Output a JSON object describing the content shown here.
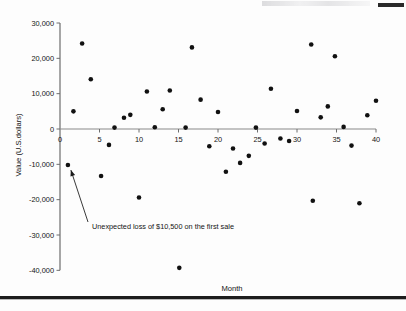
{
  "page": {
    "background_color": "#ffffff",
    "bottom_rule_color": "#1d1d1d"
  },
  "chart_data": {
    "type": "scatter",
    "title": "",
    "xlabel": "Month",
    "ylabel": "Value (U.S.dollars)",
    "xlim": [
      0,
      40
    ],
    "ylim": [
      -40000,
      30000
    ],
    "xticks": [
      0,
      5,
      10,
      15,
      20,
      25,
      30,
      35,
      40
    ],
    "xtick_labels": [
      "0",
      "5",
      "10",
      "15",
      "20",
      "25",
      "30",
      "35",
      "40"
    ],
    "yticks": [
      30000,
      20000,
      10000,
      0,
      -10000,
      -20000,
      -30000,
      -40000
    ],
    "ytick_labels": [
      "30,000",
      "20,000",
      "10,000",
      "0",
      "-10,000",
      "-20,000",
      "-30,000",
      "-40,000"
    ],
    "grid": false,
    "legend": false,
    "marker_color": "#111111",
    "marker_size": 2.3,
    "series": [
      {
        "name": "Sale value",
        "points": [
          [
            1,
            -10200
          ],
          [
            1.7,
            5000
          ],
          [
            2.8,
            24200
          ],
          [
            3.9,
            14100
          ],
          [
            5.2,
            -13300
          ],
          [
            6.2,
            -4500
          ],
          [
            6.9,
            400
          ],
          [
            8.1,
            3200
          ],
          [
            8.9,
            4000
          ],
          [
            10,
            -19400
          ],
          [
            11,
            10600
          ],
          [
            12,
            500
          ],
          [
            13,
            5600
          ],
          [
            13.9,
            10900
          ],
          [
            15.1,
            -39300
          ],
          [
            15.9,
            400
          ],
          [
            16.7,
            23100
          ],
          [
            17.8,
            8300
          ],
          [
            18.9,
            -4900
          ],
          [
            20,
            4800
          ],
          [
            21,
            -12100
          ],
          [
            21.9,
            -5500
          ],
          [
            22.8,
            -9600
          ],
          [
            23.9,
            -7600
          ],
          [
            24.8,
            400
          ],
          [
            25.9,
            -4100
          ],
          [
            26.7,
            11400
          ],
          [
            27.9,
            -2700
          ],
          [
            29,
            -3400
          ],
          [
            30,
            5100
          ],
          [
            31.8,
            23900
          ],
          [
            32,
            -20300
          ],
          [
            33,
            3300
          ],
          [
            33.9,
            6400
          ],
          [
            34.8,
            20600
          ],
          [
            35.9,
            600
          ],
          [
            36.9,
            -4700
          ],
          [
            37.9,
            -21000
          ],
          [
            38.9,
            3900
          ],
          [
            40,
            8000
          ]
        ]
      }
    ],
    "annotations": [
      {
        "text": "Unexpected loss of $10,500 on the first sale",
        "target_point": [
          1,
          -10500
        ],
        "arrow": true
      }
    ]
  }
}
